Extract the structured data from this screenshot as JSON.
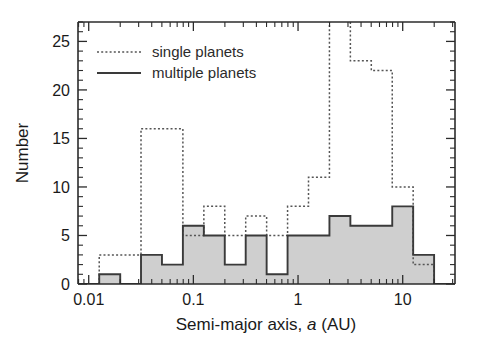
{
  "figure": {
    "title": "",
    "background": "#ffffff"
  },
  "axes": {
    "xlabel_prefix": "Semi-major axis, ",
    "xlabel_italic": "a",
    "xlabel_suffix": " (AU)",
    "ylabel": "Number",
    "x_ticklabels": [
      "0.01",
      "0.1",
      "1",
      "10"
    ],
    "y_ticklabels": [
      "0",
      "5",
      "10",
      "15",
      "20",
      "25"
    ]
  },
  "legend": {
    "items": [
      {
        "label": "single planets",
        "style": "dotted",
        "color": "#555555"
      },
      {
        "label": "multiple planets",
        "style": "solid",
        "color": "#3a3a3a"
      }
    ]
  },
  "chart_data": {
    "type": "bar",
    "title": "",
    "xlabel": "Semi-major axis, a (AU)",
    "ylabel": "Number",
    "xscale": "log",
    "xlim": [
      0.0079,
      31.6
    ],
    "ylim": [
      0,
      27
    ],
    "grid": false,
    "legend_position": "upper-left",
    "x_major_ticks": [
      0.01,
      0.1,
      1,
      10
    ],
    "y_major_ticks": [
      0,
      5,
      10,
      15,
      20,
      25
    ],
    "bin_edges_dex": [
      -2.1,
      -1.9,
      -1.7,
      -1.5,
      -1.3,
      -1.1,
      -0.9,
      -0.7,
      -0.5,
      -0.3,
      -0.1,
      0.1,
      0.3,
      0.5,
      0.7,
      0.9,
      1.1,
      1.3,
      1.5
    ],
    "bin_edges_au": [
      0.0079,
      0.0126,
      0.02,
      0.0316,
      0.0501,
      0.0794,
      0.1259,
      0.1995,
      0.3162,
      0.5012,
      0.7943,
      1.2589,
      1.9953,
      3.1623,
      5.0119,
      7.9433,
      12.589,
      19.953,
      31.623
    ],
    "series": [
      {
        "name": "single planets",
        "style": "dotted",
        "color": "#555555",
        "values": [
          0,
          3,
          3,
          16,
          16,
          5,
          8,
          5,
          7,
          5,
          8,
          11,
          30,
          23,
          22,
          10,
          2,
          0
        ]
      },
      {
        "name": "multiple planets",
        "style": "solid-filled",
        "color": "#3a3a3a",
        "fill": "#cfcfcf",
        "values": [
          0,
          1,
          0,
          3,
          2,
          6,
          5,
          2,
          5,
          1,
          5,
          5,
          7,
          6,
          6,
          8,
          3,
          0
        ]
      }
    ]
  }
}
